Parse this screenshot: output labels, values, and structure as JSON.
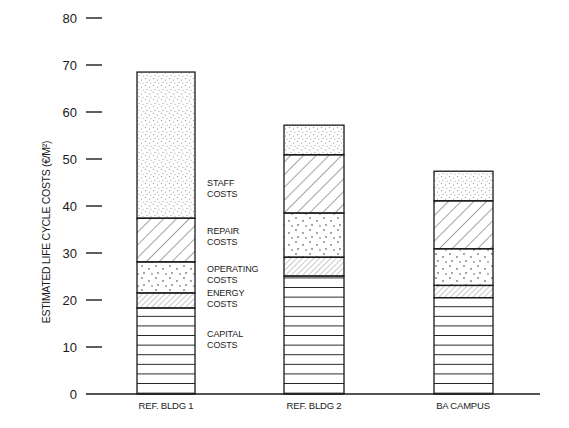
{
  "chart_data": {
    "type": "bar",
    "stacked": true,
    "title": "",
    "xlabel": "",
    "ylabel": "ESTIMATED LIFE CYCLE COSTS (€/M²)",
    "ylim": [
      0,
      80
    ],
    "yticks": [
      0,
      10,
      20,
      30,
      40,
      50,
      60,
      70,
      80
    ],
    "grid": false,
    "legend_position": "inline labels right of first bar",
    "categories": [
      "REF. BLDG 1",
      "REF. BLDG 2",
      "BA CAMPUS"
    ],
    "series": [
      {
        "name": "CAPITAL COSTS",
        "pattern": "horizontal-lines",
        "values": [
          18.3,
          25.1,
          20.5
        ]
      },
      {
        "name": "ENERGY COSTS",
        "pattern": "fine-hatch",
        "values": [
          3.2,
          4.0,
          2.6
        ]
      },
      {
        "name": "OPERATING COSTS",
        "pattern": "sparse-dots",
        "values": [
          6.6,
          9.4,
          7.8
        ]
      },
      {
        "name": "REPAIR COSTS",
        "pattern": "diagonal-hatch",
        "values": [
          9.3,
          12.4,
          10.2
        ]
      },
      {
        "name": "STAFF COSTS",
        "pattern": "dense-stipple",
        "values": [
          31.1,
          6.3,
          6.3
        ]
      }
    ],
    "totals": [
      68.5,
      57.2,
      47.4
    ]
  },
  "labels": {
    "ylabel": "ESTIMATED LIFE CYCLE COSTS (€/M²)",
    "categories": [
      "REF. BLDG 1",
      "REF. BLDG 2",
      "BA CAMPUS"
    ],
    "segments": [
      {
        "line1": "STAFF",
        "line2": "COSTS"
      },
      {
        "line1": "REPAIR",
        "line2": "COSTS"
      },
      {
        "line1": "OPERATING",
        "line2": "COSTS"
      },
      {
        "line1": "ENERGY",
        "line2": "COSTS"
      },
      {
        "line1": "CAPITAL",
        "line2": "COSTS"
      }
    ]
  },
  "colors": {
    "ink": "#1a1a1a",
    "background": "#ffffff",
    "hatch": "#555555"
  }
}
